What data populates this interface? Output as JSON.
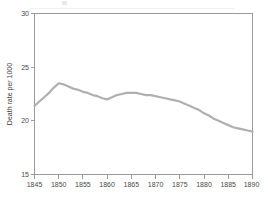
{
  "chart_data": {
    "type": "line",
    "title": "",
    "xlabel": "",
    "ylabel": "Death rate per 1000",
    "xlim": [
      1845,
      1890
    ],
    "ylim": [
      15,
      30
    ],
    "grid": false,
    "legend": "none",
    "x_ticks": [
      "1845",
      "1850",
      "1855",
      "1860",
      "1865",
      "1870",
      "1875",
      "1880",
      "1885",
      "1890"
    ],
    "y_ticks": [
      "15",
      "20",
      "25",
      "30"
    ],
    "series": [
      {
        "name": "Death rate",
        "color": "#b0b0b0",
        "x": [
          1845,
          1846,
          1847,
          1848,
          1849,
          1850,
          1851,
          1852,
          1853,
          1854,
          1855,
          1856,
          1857,
          1858,
          1859,
          1860,
          1861,
          1862,
          1863,
          1864,
          1865,
          1866,
          1867,
          1868,
          1869,
          1870,
          1871,
          1872,
          1873,
          1874,
          1875,
          1876,
          1877,
          1878,
          1879,
          1880,
          1881,
          1882,
          1883,
          1884,
          1885,
          1886,
          1887,
          1888,
          1889,
          1890
        ],
        "values": [
          21.4,
          21.8,
          22.2,
          22.6,
          23.1,
          23.5,
          23.4,
          23.2,
          23.0,
          22.9,
          22.7,
          22.6,
          22.4,
          22.3,
          22.1,
          22.0,
          22.2,
          22.4,
          22.5,
          22.6,
          22.6,
          22.6,
          22.5,
          22.4,
          22.4,
          22.3,
          22.2,
          22.1,
          22.0,
          21.9,
          21.8,
          21.6,
          21.4,
          21.2,
          21.0,
          20.7,
          20.5,
          20.2,
          20.0,
          19.8,
          19.6,
          19.4,
          19.3,
          19.2,
          19.1,
          19.0
        ]
      }
    ]
  },
  "axes": {
    "y_axis_title": "Death rate per 1000"
  }
}
